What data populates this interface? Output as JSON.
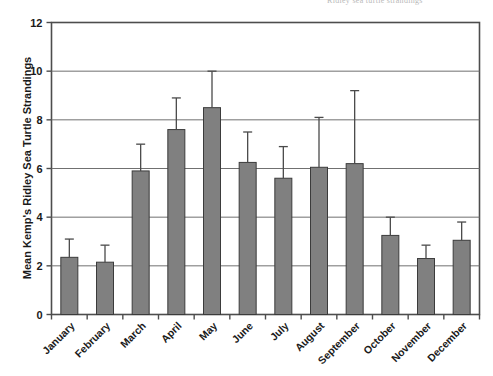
{
  "figure": {
    "scan_artifact_text": "Ridley sea turtle strandings",
    "background_color": "#ffffff"
  },
  "chart_data": {
    "type": "bar",
    "title": "",
    "xlabel": "",
    "ylabel": "Mean Kemp's Ridley Sea Turtle Strandings",
    "categories": [
      "January",
      "February",
      "March",
      "April",
      "May",
      "June",
      "July",
      "August",
      "September",
      "October",
      "November",
      "December"
    ],
    "values": [
      2.35,
      2.15,
      5.9,
      7.6,
      8.5,
      6.25,
      5.6,
      6.05,
      6.2,
      3.25,
      2.3,
      3.05
    ],
    "error_upper": [
      3.1,
      2.85,
      7.0,
      8.9,
      10.0,
      7.5,
      6.9,
      8.1,
      9.2,
      4.0,
      2.85,
      3.8
    ],
    "yticks": [
      0,
      2,
      4,
      6,
      8,
      10,
      12
    ],
    "ytick_labels": [
      "0",
      "2",
      "4",
      "6",
      "8",
      "10",
      "12"
    ],
    "ylim": [
      0,
      12
    ],
    "grid": true,
    "grid_axis": "y",
    "legend": "none",
    "bar_color": "#808080",
    "bar_edge_color": "#3b3b3b",
    "error_bar_color": "#4a4a4a",
    "axis_color": "#4d4d4d",
    "grid_color": "#707070",
    "xtick_label_rotation": 45
  }
}
